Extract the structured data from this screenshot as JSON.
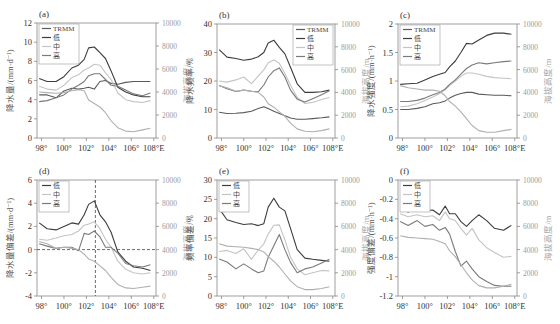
{
  "figure": {
    "xticks": [
      "98°",
      "100°",
      "102°",
      "104°",
      "106°",
      "108°E"
    ],
    "xtick_values": [
      98,
      100,
      102,
      104,
      106,
      108
    ],
    "right_axis_label": "海拔高度/m",
    "right_ticks": [
      0,
      2000,
      4000,
      6000,
      8000,
      10000
    ],
    "colors": {
      "TRMM": "#5a5a5a",
      "低": "#3c3c3c",
      "中": "#c4c4c4",
      "高": "#7a7a7a",
      "elevation": "#b0b0b0",
      "axis": "#888888",
      "tick_text": "#333333"
    }
  },
  "chart_data": [
    {
      "id": "a",
      "panel_label": "(a)",
      "type": "line",
      "ylabel": "降水量/(mm·d⁻¹)",
      "ylim": [
        0,
        12
      ],
      "yticks": [
        0,
        2,
        4,
        6,
        8,
        10,
        12
      ],
      "ytick_labels": [
        "0",
        "2",
        "4",
        "6",
        "8",
        "10",
        "12"
      ],
      "legend": [
        "TRMM",
        "低",
        "中",
        "高"
      ],
      "legend_pos": "top-left",
      "x": [
        97.8,
        98.5,
        99.3,
        100.0,
        100.7,
        101.3,
        101.8,
        102.2,
        102.7,
        103.2,
        103.7,
        104.2,
        104.8,
        105.5,
        106.2,
        107.0,
        107.7
      ],
      "series": [
        {
          "name": "TRMM",
          "values": [
            4.5,
            4.5,
            4.2,
            4.9,
            5.2,
            5.1,
            5.2,
            5.3,
            5.1,
            5.9,
            6.0,
            5.7,
            5.6,
            5.8,
            5.9,
            5.9,
            5.9
          ]
        },
        {
          "name": "低",
          "values": [
            6.2,
            5.9,
            5.9,
            6.4,
            7.3,
            7.6,
            8.2,
            9.4,
            9.5,
            8.9,
            8.3,
            7.0,
            5.3,
            4.8,
            4.5,
            4.3,
            4.3
          ]
        },
        {
          "name": "中",
          "values": [
            5.4,
            5.1,
            5.0,
            5.5,
            6.3,
            6.6,
            7.1,
            7.3,
            7.7,
            7.6,
            6.8,
            6.1,
            4.7,
            4.0,
            3.8,
            3.7,
            3.9
          ]
        },
        {
          "name": "高",
          "values": [
            3.8,
            3.9,
            4.2,
            4.5,
            5.1,
            5.5,
            5.9,
            6.5,
            6.7,
            6.7,
            6.1,
            5.5,
            5.4,
            5.0,
            4.6,
            4.4,
            4.7
          ]
        },
        {
          "name": "elevation",
          "axis": "right",
          "values": [
            4000,
            3950,
            3900,
            3950,
            4100,
            4200,
            4100,
            3300,
            3000,
            2700,
            2200,
            1500,
            900,
            600,
            550,
            700,
            850
          ]
        }
      ]
    },
    {
      "id": "b",
      "panel_label": "(b)",
      "type": "line",
      "ylabel": "降水频率/%",
      "ylim": [
        0,
        40
      ],
      "yticks": [
        0,
        10,
        20,
        30,
        40
      ],
      "ytick_labels": [
        "0",
        "10",
        "20",
        "30",
        "40"
      ],
      "legend": [
        "TRMM",
        "低",
        "中",
        "高"
      ],
      "legend_pos": "top-right",
      "x": [
        97.8,
        98.5,
        99.3,
        100.0,
        100.7,
        101.3,
        101.8,
        102.2,
        102.7,
        103.2,
        103.7,
        104.2,
        104.8,
        105.5,
        106.2,
        107.0,
        107.7
      ],
      "series": [
        {
          "name": "TRMM",
          "values": [
            9.0,
            8.6,
            8.7,
            8.9,
            9.4,
            10.3,
            11.0,
            10.3,
            9.4,
            8.6,
            7.8,
            7.0,
            6.6,
            6.6,
            6.8,
            7.1,
            7.4
          ]
        },
        {
          "name": "低",
          "values": [
            31.0,
            28.4,
            27.9,
            27.3,
            27.7,
            28.5,
            30.0,
            33.3,
            34.3,
            31.8,
            29.5,
            24.8,
            19.0,
            16.0,
            16.0,
            16.2,
            16.8
          ]
        },
        {
          "name": "中",
          "values": [
            20.0,
            19.6,
            20.4,
            21.4,
            19.1,
            21.7,
            23.9,
            26.4,
            27.4,
            26.2,
            22.6,
            18.5,
            14.2,
            12.1,
            12.5,
            13.5,
            14.2
          ]
        },
        {
          "name": "高",
          "values": [
            18.4,
            17.3,
            16.3,
            16.8,
            16.4,
            16.2,
            18.6,
            21.4,
            23.6,
            24.6,
            21.4,
            16.8,
            13.6,
            12.6,
            13.8,
            15.2,
            16.6
          ]
        },
        {
          "name": "elevation",
          "axis": "right",
          "values": [
            4600,
            4400,
            4100,
            4200,
            4100,
            4000,
            3600,
            3000,
            2700,
            2300,
            1900,
            1300,
            800,
            600,
            550,
            650,
            800
          ]
        }
      ]
    },
    {
      "id": "c",
      "panel_label": "(c)",
      "type": "line",
      "ylabel": "降水强度/(mm·h⁻¹)",
      "ylim": [
        0,
        2
      ],
      "yticks": [
        0,
        0.5,
        1,
        1.5,
        2
      ],
      "ytick_labels": [
        "0",
        "0.5",
        "1",
        "1.5",
        "2"
      ],
      "legend": [
        "TRMM",
        "低",
        "中",
        "高"
      ],
      "legend_pos": "top-left",
      "x": [
        97.8,
        98.5,
        99.3,
        100.0,
        100.7,
        101.3,
        101.8,
        102.2,
        102.7,
        103.2,
        103.7,
        104.2,
        104.8,
        105.5,
        106.2,
        107.0,
        107.7
      ],
      "series": [
        {
          "name": "TRMM",
          "values": [
            0.5,
            0.5,
            0.52,
            0.55,
            0.6,
            0.62,
            0.65,
            0.7,
            0.75,
            0.78,
            0.8,
            0.8,
            0.77,
            0.76,
            0.75,
            0.75,
            0.74
          ]
        },
        {
          "name": "低",
          "values": [
            0.94,
            0.95,
            0.96,
            1.02,
            1.08,
            1.12,
            1.15,
            1.25,
            1.35,
            1.5,
            1.66,
            1.65,
            1.72,
            1.8,
            1.84,
            1.84,
            1.82
          ]
        },
        {
          "name": "中",
          "values": [
            0.55,
            0.56,
            0.6,
            0.66,
            0.72,
            0.78,
            0.85,
            0.92,
            1.0,
            1.08,
            1.14,
            1.14,
            1.12,
            1.08,
            1.06,
            1.05,
            1.04
          ]
        },
        {
          "name": "高",
          "values": [
            0.64,
            0.64,
            0.66,
            0.7,
            0.76,
            0.8,
            0.86,
            0.94,
            1.02,
            1.12,
            1.22,
            1.28,
            1.32,
            1.3,
            1.32,
            1.34,
            1.35
          ]
        },
        {
          "name": "elevation",
          "axis": "right",
          "values": [
            4600,
            4400,
            4300,
            4200,
            4200,
            4100,
            3700,
            3200,
            2800,
            2300,
            1700,
            1100,
            650,
            500,
            500,
            650,
            750
          ]
        }
      ]
    },
    {
      "id": "d",
      "panel_label": "(d)",
      "type": "line",
      "ylabel": "降水量偏差/(mm·d⁻¹)",
      "ylim": [
        -4,
        6
      ],
      "yticks": [
        -4,
        -2,
        0,
        2,
        4,
        6
      ],
      "ytick_labels": [
        "-4",
        "-2",
        "0",
        "2",
        "4",
        "6"
      ],
      "legend": [
        "低",
        "中",
        "高"
      ],
      "legend_pos": "top-left",
      "reference_lines": {
        "y": 0,
        "x": 102.8
      },
      "x": [
        97.8,
        98.5,
        99.3,
        100.0,
        100.7,
        101.3,
        101.8,
        102.2,
        102.7,
        103.2,
        103.7,
        104.2,
        104.8,
        105.5,
        106.2,
        107.0,
        107.7
      ],
      "series": [
        {
          "name": "低",
          "values": [
            2.3,
            1.8,
            1.7,
            2.0,
            2.3,
            2.2,
            3.0,
            3.9,
            4.2,
            3.0,
            2.4,
            1.5,
            -0.2,
            -1.0,
            -1.5,
            -1.6,
            -1.8
          ]
        },
        {
          "name": "中",
          "values": [
            0.9,
            0.8,
            1.0,
            1.2,
            1.3,
            1.6,
            2.1,
            2.2,
            2.4,
            1.8,
            0.9,
            0.2,
            -1.0,
            -1.7,
            -2.0,
            -2.1,
            -2.0
          ]
        },
        {
          "name": "高",
          "values": [
            0.5,
            0.3,
            0.1,
            0.2,
            0.2,
            -0.1,
            1.4,
            1.3,
            1.6,
            1.1,
            0.2,
            0.2,
            -0.3,
            -1.2,
            -1.4,
            -1.5,
            -1.3
          ]
        },
        {
          "name": "elevation",
          "axis": "right",
          "values": [
            4700,
            4500,
            4100,
            4200,
            4100,
            4000,
            3600,
            3200,
            3000,
            2600,
            2200,
            1600,
            1000,
            700,
            650,
            750,
            850
          ]
        }
      ]
    },
    {
      "id": "e",
      "panel_label": "(e)",
      "type": "line",
      "ylabel": "频率偏差/%",
      "ylim": [
        0,
        30
      ],
      "yticks": [
        0,
        5,
        10,
        15,
        20,
        25,
        30
      ],
      "ytick_labels": [
        "0",
        "5",
        "10",
        "15",
        "20",
        "25",
        "30"
      ],
      "legend": [
        "低",
        "中",
        "高"
      ],
      "legend_pos": "top-left",
      "x": [
        97.8,
        98.5,
        99.3,
        100.0,
        100.7,
        101.3,
        101.8,
        102.2,
        102.7,
        103.2,
        103.7,
        104.2,
        104.8,
        105.5,
        106.2,
        107.0,
        107.7
      ],
      "series": [
        {
          "name": "低",
          "values": [
            22.6,
            19.7,
            19.0,
            18.5,
            18.7,
            18.2,
            18.7,
            23.0,
            25.3,
            23.0,
            22.0,
            17.5,
            12.0,
            9.8,
            9.5,
            9.2,
            9.0
          ]
        },
        {
          "name": "中",
          "values": [
            11.5,
            11.8,
            11.0,
            12.2,
            9.5,
            11.9,
            13.5,
            16.0,
            18.3,
            18.4,
            14.5,
            10.0,
            7.0,
            5.5,
            6.0,
            6.6,
            6.5
          ]
        },
        {
          "name": "高",
          "values": [
            9.6,
            8.8,
            7.0,
            8.3,
            7.0,
            6.0,
            6.5,
            10.0,
            13.0,
            15.9,
            12.0,
            8.7,
            6.0,
            7.0,
            7.5,
            8.5,
            9.5
          ]
        },
        {
          "name": "elevation",
          "axis": "right",
          "values": [
            4500,
            4300,
            4250,
            4200,
            4100,
            4000,
            3800,
            3400,
            3000,
            2500,
            1900,
            1300,
            800,
            550,
            550,
            650,
            800
          ]
        }
      ]
    },
    {
      "id": "f",
      "panel_label": "(f)",
      "type": "line",
      "ylabel": "强度偏差/(mm·h⁻¹)",
      "ylim": [
        -1.2,
        0
      ],
      "yticks": [
        -1.2,
        -1,
        -0.8,
        -0.6,
        -0.4,
        -0.2,
        0
      ],
      "ytick_labels": [
        "-1.2",
        "-1",
        "-0.8",
        "-0.6",
        "-0.4",
        "-0.2",
        "0"
      ],
      "legend": [
        "低",
        "中",
        "高"
      ],
      "legend_pos": "top-left",
      "x": [
        97.8,
        98.5,
        99.3,
        100.0,
        100.7,
        101.3,
        101.8,
        102.2,
        102.7,
        103.2,
        103.7,
        104.2,
        104.8,
        105.5,
        106.2,
        107.0,
        107.7
      ],
      "series": [
        {
          "name": "低",
          "values": [
            -0.3,
            -0.33,
            -0.3,
            -0.32,
            -0.31,
            -0.36,
            -0.27,
            -0.35,
            -0.35,
            -0.43,
            -0.48,
            -0.42,
            -0.36,
            -0.42,
            -0.5,
            -0.52,
            -0.47
          ]
        },
        {
          "name": "中",
          "values": [
            -0.35,
            -0.38,
            -0.36,
            -0.38,
            -0.37,
            -0.42,
            -0.33,
            -0.4,
            -0.42,
            -0.5,
            -0.57,
            -0.5,
            -0.62,
            -0.7,
            -0.75,
            -0.8,
            -0.79
          ]
        },
        {
          "name": "高",
          "values": [
            -0.43,
            -0.47,
            -0.42,
            -0.48,
            -0.46,
            -0.52,
            -0.49,
            -0.56,
            -0.74,
            -0.89,
            -0.84,
            -0.92,
            -1.0,
            -1.05,
            -1.09,
            -1.1,
            -1.1
          ]
        },
        {
          "name": "elevation",
          "axis": "right",
          "values": [
            5200,
            5050,
            5000,
            4950,
            4900,
            4700,
            4500,
            3900,
            3400,
            2700,
            2000,
            1400,
            900,
            700,
            700,
            850,
            1000
          ]
        }
      ]
    }
  ]
}
